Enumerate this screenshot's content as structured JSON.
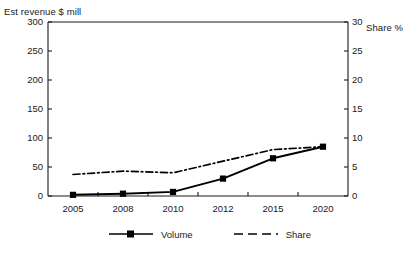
{
  "chart_data": {
    "type": "line",
    "title": "",
    "ylabel": "Est revenue $ mill",
    "y2label": "Share %",
    "xlabel": "",
    "categories": [
      "2005",
      "2008",
      "2010",
      "2012",
      "2015",
      "2020"
    ],
    "yticks": [
      "0",
      "50",
      "100",
      "150",
      "200",
      "250",
      "300"
    ],
    "y2ticks": [
      "0",
      "5",
      "10",
      "15",
      "20",
      "25",
      "30"
    ],
    "ylim": [
      0,
      300
    ],
    "y2lim": [
      0,
      30
    ],
    "grid": false,
    "legend_position": "bottom",
    "series": [
      {
        "name": "Volume",
        "axis": "left",
        "style": "solid",
        "marker": "square",
        "color": "#000000",
        "values": [
          2,
          4,
          7,
          30,
          65,
          85
        ]
      },
      {
        "name": "Share",
        "axis": "right",
        "style": "dash-dot",
        "marker": "none",
        "color": "#000000",
        "values": [
          3.7,
          4.3,
          4.0,
          6.0,
          8.0,
          8.5
        ]
      }
    ]
  },
  "legend": {
    "volume_label": "Volume",
    "share_label": "Share"
  }
}
